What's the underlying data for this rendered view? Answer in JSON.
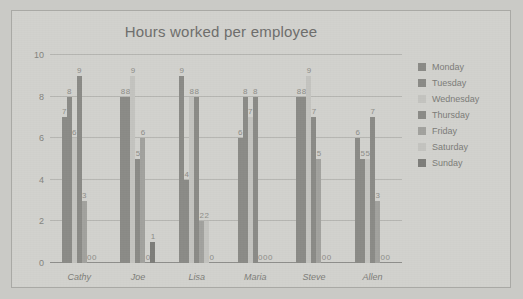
{
  "chart_data": {
    "type": "bar",
    "title": "Hours worked per employee",
    "xlabel": "",
    "ylabel": "",
    "ylim": [
      0,
      10
    ],
    "yticks": [
      0,
      2,
      4,
      6,
      8,
      10
    ],
    "grid": true,
    "legend_position": "right",
    "categories": [
      "Cathy",
      "Joe",
      "Lisa",
      "Maria",
      "Steve",
      "Allen"
    ],
    "series": [
      {
        "name": "Monday",
        "color": "#8b8b87",
        "values": [
          7,
          8,
          9,
          6,
          8,
          6
        ]
      },
      {
        "name": "Tuesday",
        "color": "#8b8b87",
        "values": [
          8,
          8,
          4,
          8,
          8,
          5
        ]
      },
      {
        "name": "Wednesday",
        "color": "#c4c4c0",
        "values": [
          6,
          9,
          8,
          7,
          9,
          5
        ]
      },
      {
        "name": "Thursday",
        "color": "#8b8b87",
        "values": [
          9,
          5,
          8,
          8,
          7,
          7
        ]
      },
      {
        "name": "Friday",
        "color": "#a2a29e",
        "values": [
          3,
          6,
          2,
          0,
          5,
          3
        ]
      },
      {
        "name": "Saturday",
        "color": "#c4c4c0",
        "values": [
          0,
          0,
          2,
          0,
          0,
          0
        ]
      },
      {
        "name": "Sunday",
        "color": "#7e7e7a",
        "values": [
          0,
          1,
          0,
          0,
          0,
          0
        ]
      }
    ],
    "bar_labels": {
      "Cathy": [
        "7",
        "8",
        "6",
        "9",
        "3",
        "0",
        "0"
      ],
      "Joe": [
        "8",
        "8",
        "9",
        "5",
        "6",
        "0",
        "1"
      ],
      "Lisa": [
        "9",
        "4",
        "8",
        "8",
        "2",
        "2",
        "0"
      ],
      "Maria": [
        "6",
        "8",
        "7",
        "8",
        "0",
        "0",
        "0"
      ],
      "Steve": [
        "8",
        "8",
        "9",
        "7",
        "5",
        "0",
        "0"
      ],
      "Allen": [
        "6",
        "5",
        "5",
        "7",
        "3",
        "0",
        "0"
      ]
    }
  },
  "colors": {
    "page_background": "#cacac6",
    "card_background": "#d2d2ce",
    "card_border": "#a9a9a5",
    "gridline": "#b6b6b2",
    "axis": "#8f8f8c",
    "title_text": "#6e6e6c",
    "tick_text": "#84847f",
    "label_text": "#8d8d88"
  }
}
